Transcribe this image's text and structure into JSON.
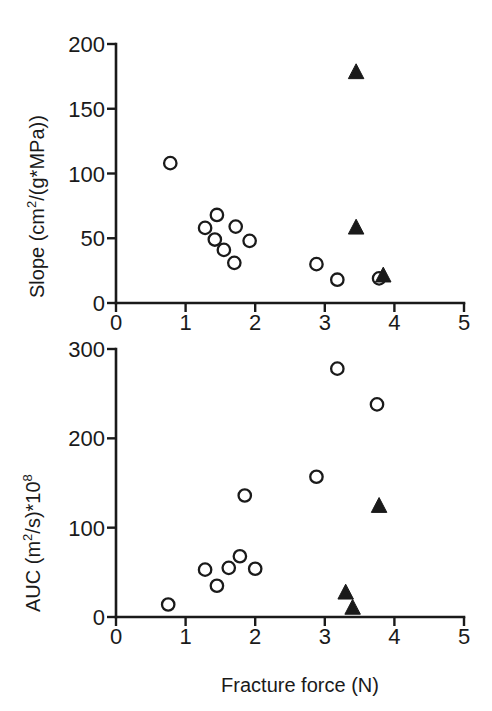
{
  "figure": {
    "background": "#ffffff",
    "ink_color": "#1a1a1a",
    "panel_count": 2,
    "shared_xlabel": "Fracture force (N)"
  },
  "chart_data": [
    {
      "type": "scatter",
      "panel": "top",
      "title": "",
      "xlabel": "Fracture force (N)",
      "ylabel": "Slope  (cm2/(g*MPa))",
      "ylabel_parts": {
        "prefix": "Slope  (cm",
        "superscript": "2",
        "suffix": "/(g*MPa))"
      },
      "xlim": [
        0,
        5
      ],
      "ylim": [
        0,
        200
      ],
      "xticks": [
        0,
        1,
        2,
        3,
        4,
        5
      ],
      "xticklabels": [
        "0",
        "1",
        "2",
        "3",
        "4",
        "5"
      ],
      "yticks": [
        0,
        50,
        100,
        150,
        200
      ],
      "yticklabels": [
        "0",
        "50",
        "100",
        "150",
        "200"
      ],
      "grid": false,
      "legend": null,
      "series": [
        {
          "name": "open-circle",
          "marker": "open-circle",
          "color": "#1a1a1a",
          "points": [
            [
              0.78,
              108
            ],
            [
              1.28,
              58
            ],
            [
              1.45,
              68
            ],
            [
              1.42,
              49
            ],
            [
              1.55,
              41
            ],
            [
              1.72,
              59
            ],
            [
              1.7,
              31
            ],
            [
              1.92,
              48
            ],
            [
              2.88,
              30
            ],
            [
              3.18,
              18
            ],
            [
              3.78,
              19
            ]
          ]
        },
        {
          "name": "filled-triangle",
          "marker": "filled-triangle",
          "color": "#1a1a1a",
          "points": [
            [
              3.45,
              178
            ],
            [
              3.45,
              58
            ],
            [
              3.84,
              21
            ]
          ]
        }
      ]
    },
    {
      "type": "scatter",
      "panel": "bottom",
      "title": "",
      "xlabel": "Fracture force (N)",
      "ylabel": "AUC (m2/s)*108",
      "ylabel_parts": {
        "prefix": "AUC (m",
        "superscript": "2",
        "middle": "/s)*10",
        "superscript2": "8"
      },
      "xlim": [
        0,
        5
      ],
      "ylim": [
        0,
        300
      ],
      "xticks": [
        0,
        1,
        2,
        3,
        4,
        5
      ],
      "xticklabels": [
        "0",
        "1",
        "2",
        "3",
        "4",
        "5"
      ],
      "yticks": [
        0,
        100,
        200,
        300
      ],
      "yticklabels": [
        "0",
        "100",
        "200",
        "300"
      ],
      "grid": false,
      "legend": null,
      "series": [
        {
          "name": "open-circle",
          "marker": "open-circle",
          "color": "#1a1a1a",
          "points": [
            [
              0.75,
              14
            ],
            [
              1.28,
              53
            ],
            [
              1.45,
              35
            ],
            [
              1.62,
              55
            ],
            [
              1.78,
              68
            ],
            [
              1.85,
              136
            ],
            [
              2.0,
              54
            ],
            [
              2.88,
              157
            ],
            [
              3.18,
              278
            ],
            [
              3.75,
              238
            ]
          ]
        },
        {
          "name": "filled-triangle",
          "marker": "filled-triangle",
          "color": "#1a1a1a",
          "points": [
            [
              3.3,
              27
            ],
            [
              3.4,
              10
            ],
            [
              3.78,
              124
            ]
          ]
        }
      ]
    }
  ]
}
